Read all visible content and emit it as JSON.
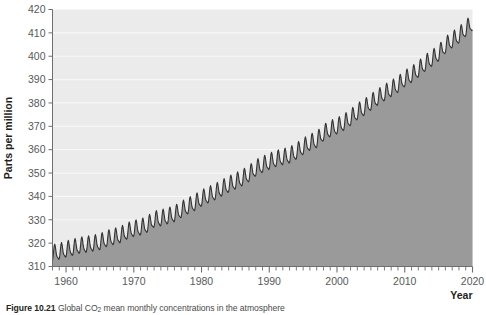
{
  "figure": {
    "caption_label": "Figure 10.21",
    "caption_text_a": " Global CO",
    "caption_subscript": "2",
    "caption_text_b": " mean monthly concentrations in the atmosphere"
  },
  "colors": {
    "plot_background": "#ebebeb",
    "area_fill": "#9a9a9a",
    "line": "#333333",
    "gridline": "#f7f7f7",
    "axis": "#6d6e71",
    "tick_text": "#58595b",
    "label_text": "#231f20"
  },
  "chart_data": {
    "type": "area",
    "title": "",
    "xlabel": "Year",
    "ylabel": "Parts per million",
    "xlim": [
      1958,
      2020
    ],
    "ylim": [
      310,
      420
    ],
    "ytick_labels": [
      "310",
      "320",
      "330",
      "340",
      "350",
      "360",
      "370",
      "380",
      "390",
      "400",
      "410",
      "420"
    ],
    "ytick_values": [
      310,
      320,
      330,
      340,
      350,
      360,
      370,
      380,
      390,
      400,
      410,
      420
    ],
    "xtick_labels": [
      "1960",
      "1970",
      "1980",
      "1990",
      "2000",
      "2010",
      "2020"
    ],
    "xtick_values": [
      1960,
      1970,
      1980,
      1990,
      2000,
      2010,
      2020
    ],
    "minor_xtick_interval": 1,
    "grid": "horizontal",
    "legend": "none",
    "series_name": "Global CO2 mean monthly concentration",
    "units": "ppm",
    "seasonal_amplitude_ppm": 3.2,
    "seasonal_peak_month": 5,
    "annual_mean": {
      "x": [
        1958,
        1959,
        1960,
        1961,
        1962,
        1963,
        1964,
        1965,
        1966,
        1967,
        1968,
        1969,
        1970,
        1971,
        1972,
        1973,
        1974,
        1975,
        1976,
        1977,
        1978,
        1979,
        1980,
        1981,
        1982,
        1983,
        1984,
        1985,
        1986,
        1987,
        1988,
        1989,
        1990,
        1991,
        1992,
        1993,
        1994,
        1995,
        1996,
        1997,
        1998,
        1999,
        2000,
        2001,
        2002,
        2003,
        2004,
        2005,
        2006,
        2007,
        2008,
        2009,
        2010,
        2011,
        2012,
        2013,
        2014,
        2015,
        2016,
        2017,
        2018,
        2019,
        2020
      ],
      "y": [
        315.3,
        315.9,
        316.9,
        317.6,
        318.5,
        318.9,
        319.4,
        320.0,
        321.4,
        322.2,
        323.0,
        324.6,
        325.7,
        326.3,
        327.5,
        329.7,
        330.2,
        331.1,
        332.0,
        333.8,
        335.4,
        336.8,
        338.7,
        340.1,
        341.4,
        343.0,
        344.6,
        346.0,
        347.4,
        349.2,
        351.6,
        353.1,
        354.4,
        355.6,
        356.4,
        357.1,
        358.8,
        360.8,
        362.6,
        363.7,
        366.7,
        368.4,
        369.6,
        371.1,
        373.2,
        375.8,
        377.5,
        379.8,
        381.9,
        383.8,
        385.6,
        387.4,
        389.9,
        391.6,
        393.9,
        396.5,
        398.6,
        400.8,
        404.2,
        406.5,
        408.5,
        411.4,
        414.0
      ]
    }
  }
}
